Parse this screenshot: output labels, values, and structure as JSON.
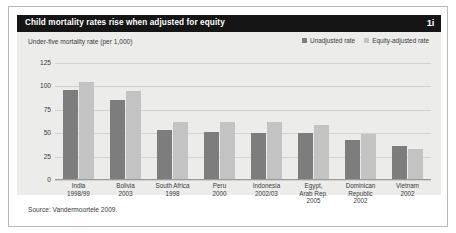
{
  "header": {
    "title": "Child mortality rates rise when adjusted for equity",
    "figure_number": "1i"
  },
  "legend": {
    "items": [
      {
        "label": "Unadjusted rate",
        "color": "#7d7d7d",
        "swatch": "legend-swatch-unadjusted"
      },
      {
        "label": "Equity-adjusted rate",
        "color": "#c3c3c3",
        "swatch": "legend-swatch-equity"
      }
    ]
  },
  "source": "Source: Vandermoortele 2009.",
  "chart_data": {
    "type": "bar",
    "title": "Child mortality rates rise when adjusted for equity",
    "ylabel": "Under-five mortality rate (per 1,000)",
    "xlabel": "",
    "ylim": [
      0,
      125
    ],
    "yticks": [
      0,
      25,
      50,
      75,
      100,
      125
    ],
    "ytick_labels": [
      "0",
      "25",
      "50",
      "75",
      "100",
      "125"
    ],
    "grid": true,
    "legend_position": "top-right",
    "categories": [
      "India\n1998/99",
      "Bolivia\n2003",
      "South Africa\n1998",
      "Peru\n2000",
      "Indonesia\n2002/03",
      "Egypt,\nArab Rep.\n2005",
      "Dominican\nRepublic\n2002",
      "Vietnam\n2002"
    ],
    "category_lines": [
      [
        "India",
        "1998/99"
      ],
      [
        "Bolivia",
        "2003"
      ],
      [
        "South Africa",
        "1998"
      ],
      [
        "Peru",
        "2000"
      ],
      [
        "Indonesia",
        "2002/03"
      ],
      [
        "Egypt,",
        "Arab Rep.",
        "2005"
      ],
      [
        "Dominican",
        "Republic",
        "2002"
      ],
      [
        "Vietnam",
        "2002"
      ]
    ],
    "series": [
      {
        "name": "Unadjusted rate",
        "color": "#7d7d7d",
        "values": [
          96,
          85,
          53,
          51,
          50,
          50,
          42,
          36
        ]
      },
      {
        "name": "Equity-adjusted rate",
        "color": "#c3c3c3",
        "values": [
          105,
          95,
          61,
          61,
          61,
          58,
          48,
          32
        ]
      }
    ]
  }
}
